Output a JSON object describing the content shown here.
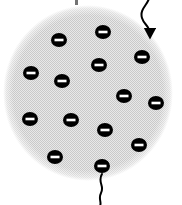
{
  "figure": {
    "width": 182,
    "height": 205,
    "background_color": "#ffffff"
  },
  "sphere": {
    "name": "charged-sphere",
    "center_x": 88,
    "center_y": 93,
    "radius_x": 85,
    "radius_y": 88,
    "fill_color": "#e8e8e8",
    "pattern": "halftone-dot-screen",
    "pattern_dot_color": "#c9c9c9",
    "pattern_spacing": 2,
    "edge_style": "soft-stippled"
  },
  "charges": {
    "symbol": "minus",
    "label": "negative charge",
    "body_color": "#000000",
    "sign_color": "#ffffff",
    "width": 16,
    "height": 14,
    "sign_width": 9,
    "sign_height": 2.6,
    "count": 14,
    "items": [
      {
        "id": "charge-1",
        "x": 59,
        "y": 40
      },
      {
        "id": "charge-2",
        "x": 103,
        "y": 32
      },
      {
        "id": "charge-3",
        "x": 142,
        "y": 57
      },
      {
        "id": "charge-4",
        "x": 31,
        "y": 73
      },
      {
        "id": "charge-5",
        "x": 99,
        "y": 65
      },
      {
        "id": "charge-6",
        "x": 62,
        "y": 81
      },
      {
        "id": "charge-7",
        "x": 124,
        "y": 96
      },
      {
        "id": "charge-8",
        "x": 156,
        "y": 103
      },
      {
        "id": "charge-9",
        "x": 30,
        "y": 119
      },
      {
        "id": "charge-10",
        "x": 71,
        "y": 120
      },
      {
        "id": "charge-11",
        "x": 105,
        "y": 130
      },
      {
        "id": "charge-12",
        "x": 139,
        "y": 145
      },
      {
        "id": "charge-13",
        "x": 55,
        "y": 157
      },
      {
        "id": "charge-14",
        "x": 102,
        "y": 166
      }
    ]
  },
  "wires": {
    "color": "#000000",
    "stroke_width": 2,
    "items": [
      {
        "id": "wire-top",
        "label": "incoming-lead-arrow",
        "path": "M 150 -6 C 150 4, 139 8, 142 18 C 144 25, 150 26, 150 34",
        "has_arrowhead": true,
        "arrow_x": 150,
        "arrow_y": 37
      },
      {
        "id": "wire-bottom",
        "label": "outgoing-lead",
        "path": "M 102 174 C 97 182, 105 186, 101 193 C 98 199, 102 202, 100 206",
        "has_arrowhead": false
      }
    ]
  },
  "marks": {
    "items": [
      {
        "id": "tick-top",
        "x": 75,
        "y": 0,
        "width": 3,
        "height": 5
      }
    ]
  }
}
